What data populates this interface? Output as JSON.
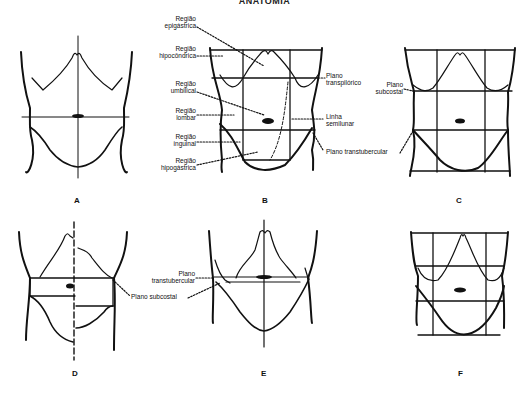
{
  "title": "ANATOMIA",
  "panels": {
    "A": {
      "letter": "A"
    },
    "B": {
      "letter": "B",
      "labels_left": [
        {
          "line1": "Região",
          "line2": "epigástrica"
        },
        {
          "line1": "Região",
          "line2": "hipocôndrica"
        },
        {
          "line1": "Região",
          "line2": "umbilical"
        },
        {
          "line1": "Região",
          "line2": "lombar"
        },
        {
          "line1": "Região",
          "line2": "inguinal"
        },
        {
          "line1": "Região",
          "line2": "hipogástrica"
        }
      ],
      "labels_right": [
        {
          "line1": "Plano",
          "line2": "transpilórico"
        },
        {
          "line1": "Linha",
          "line2": "semilunar"
        },
        {
          "line1": "Plano transtubercular",
          "line2": ""
        }
      ]
    },
    "C": {
      "letter": "C",
      "labels": [
        {
          "line1": "Plano",
          "line2": "subcostal"
        }
      ]
    },
    "D": {
      "letter": "D",
      "labels": [
        {
          "line1": "Plano subcostal"
        }
      ]
    },
    "E": {
      "letter": "E",
      "labels": [
        {
          "line1": "Plano",
          "line2": "transtubercular"
        }
      ]
    },
    "F": {
      "letter": "F"
    }
  }
}
